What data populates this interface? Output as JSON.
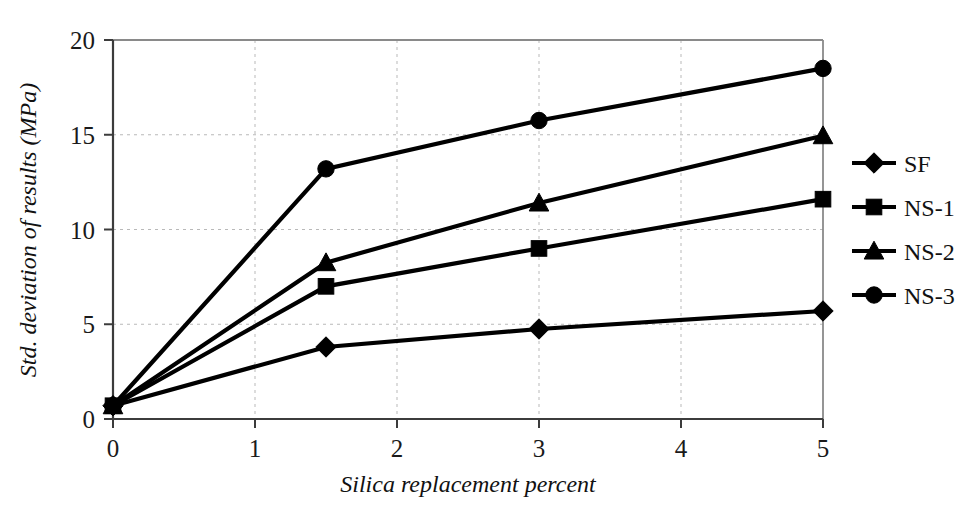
{
  "chart_data": {
    "type": "line",
    "title": "",
    "xlabel": "Silica replacement percent",
    "ylabel": "Std. deviation of results (MPa)",
    "xlim": [
      0,
      5
    ],
    "ylim": [
      0,
      20
    ],
    "xticks": [
      "0",
      "1",
      "2",
      "3",
      "4",
      "5"
    ],
    "yticks": [
      "0",
      "5",
      "10",
      "15",
      "20"
    ],
    "xtick_values": [
      0,
      1,
      2,
      3,
      4,
      5
    ],
    "ytick_values": [
      0,
      5,
      10,
      15,
      20
    ],
    "grid": "dashed gridlines on both axes at tick positions (excluding axis lines)",
    "legend_position": "right-outside",
    "x": [
      0,
      1.5,
      3,
      5
    ],
    "series": [
      {
        "name": "SF",
        "marker": "diamond",
        "values": [
          0.7,
          3.8,
          4.75,
          5.7
        ]
      },
      {
        "name": "NS-1",
        "marker": "square",
        "values": [
          0.7,
          7.0,
          9.0,
          11.6
        ]
      },
      {
        "name": "NS-2",
        "marker": "triangle",
        "values": [
          0.7,
          8.25,
          11.4,
          14.95
        ]
      },
      {
        "name": "NS-3",
        "marker": "circle",
        "values": [
          0.7,
          13.2,
          15.75,
          18.5
        ]
      }
    ]
  },
  "axes": {
    "x_title": "Silica replacement percent",
    "y_title": "Std. deviation of results (MPa)",
    "x_tick_labels": [
      "0",
      "1",
      "2",
      "3",
      "4",
      "5"
    ],
    "y_tick_labels": [
      "0",
      "5",
      "10",
      "15",
      "20"
    ]
  },
  "legend": {
    "items": [
      {
        "label": "SF",
        "marker": "diamond-marker-icon"
      },
      {
        "label": "NS-1",
        "marker": "square-marker-icon"
      },
      {
        "label": "NS-2",
        "marker": "triangle-marker-icon"
      },
      {
        "label": "NS-3",
        "marker": "circle-marker-icon"
      }
    ]
  },
  "colors": {
    "series": "#000000",
    "grid": "#b9b9b9",
    "axis": "#3c3c3c",
    "frame": "#8a8a8a",
    "background": "#ffffff"
  }
}
